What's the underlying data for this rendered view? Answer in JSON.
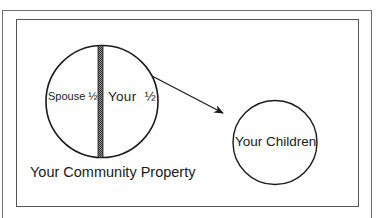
{
  "diagram": {
    "community_property": {
      "label": "Your Community Property",
      "halves": {
        "left": "Spouse ½",
        "right": "Your  ½"
      }
    },
    "children": {
      "label": "Your Children"
    },
    "arrow": {
      "from": "Your ½",
      "to": "Your Children"
    }
  },
  "colors": {
    "line": "#1a1a1a",
    "frame": "#6e6e6e",
    "divider": "#3a3a3a"
  }
}
